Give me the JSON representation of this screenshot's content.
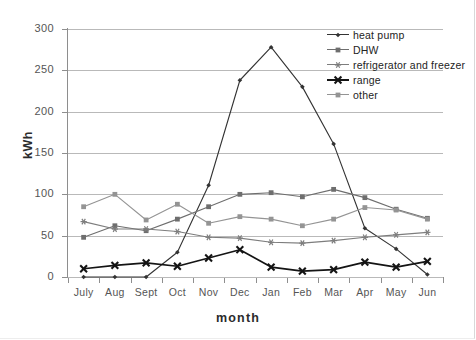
{
  "chart_data": {
    "type": "line",
    "title": "",
    "xlabel": "month",
    "ylabel": "kWh",
    "categories": [
      "July",
      "Aug",
      "Sept",
      "Oct",
      "Nov",
      "Dec",
      "Jan",
      "Feb",
      "Mar",
      "Apr",
      "May",
      "Jun"
    ],
    "ylim": [
      0,
      300
    ],
    "yticks": [
      0,
      50,
      100,
      150,
      200,
      250,
      300
    ],
    "ytick_labels": [
      "0",
      "50",
      "100",
      "150",
      "200",
      "250",
      "300"
    ],
    "grid": "horizontal",
    "legend_position": "top-right-inside",
    "series": [
      {
        "name": "heat pump",
        "color": "#333333",
        "marker": "diamond",
        "values": [
          0,
          0,
          0,
          30,
          111,
          238,
          278,
          230,
          161,
          59,
          34,
          3
        ]
      },
      {
        "name": "DHW",
        "color": "#6e6e6e",
        "marker": "square",
        "values": [
          48,
          62,
          56,
          70,
          85,
          100,
          102,
          97,
          106,
          96,
          82,
          71
        ]
      },
      {
        "name": "refrigerator and freezer",
        "color": "#7d7d7d",
        "marker": "asterisk",
        "values": [
          67,
          58,
          58,
          55,
          48,
          47,
          42,
          41,
          44,
          48,
          51,
          54
        ]
      },
      {
        "name": "range",
        "color": "#141414",
        "marker": "cross",
        "values": [
          10,
          14,
          17,
          13,
          23,
          33,
          12,
          7,
          9,
          18,
          12,
          19
        ]
      },
      {
        "name": "other",
        "color": "#949494",
        "marker": "square",
        "values": [
          85,
          100,
          69,
          88,
          65,
          73,
          70,
          62,
          70,
          84,
          81,
          70
        ]
      }
    ]
  },
  "legend": {
    "items": [
      {
        "label": "heat pump"
      },
      {
        "label": "DHW"
      },
      {
        "label": "refrigerator and freezer"
      },
      {
        "label": "range"
      },
      {
        "label": "other"
      }
    ]
  },
  "colors": {
    "gridline": "#b9b9b9",
    "axis": "#8e8e8e",
    "tick_text": "#555555",
    "axis_label_text": "#2b2b2b",
    "background": "#ffffff"
  }
}
